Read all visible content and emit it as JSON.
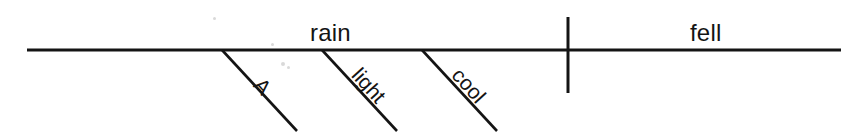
{
  "figure": {
    "kind": "reed-kellogg-sentence-diagram",
    "sentence": "A light cool rain fell.",
    "background_color": "#ffffff",
    "ink_color": "#141414"
  },
  "baseline": {
    "name": "main-horizontal-baseline",
    "x1": 27,
    "x2": 841,
    "y": 50,
    "stroke_width": 3
  },
  "divider": {
    "name": "subject-predicate-divider",
    "x": 568,
    "y1": 17,
    "y2": 93,
    "stroke_width": 3
  },
  "subject": {
    "label": "rain",
    "role": "subject",
    "x": 310,
    "y": 21
  },
  "predicate": {
    "label": "fell",
    "role": "verb",
    "x": 690,
    "y": 21
  },
  "modifiers": [
    {
      "label": "A",
      "role": "article",
      "line": {
        "x1": 222,
        "y1": 50,
        "x2": 297,
        "y2": 131
      },
      "text": {
        "x": 266,
        "y": 74,
        "rotate": 48
      }
    },
    {
      "label": "light",
      "role": "adjective",
      "line": {
        "x1": 322,
        "y1": 50,
        "x2": 397,
        "y2": 131
      },
      "text": {
        "x": 364,
        "y": 64,
        "rotate": 48
      }
    },
    {
      "label": "cool",
      "role": "adjective",
      "line": {
        "x1": 422,
        "y1": 50,
        "x2": 497,
        "y2": 131
      },
      "text": {
        "x": 464,
        "y": 64,
        "rotate": 48
      }
    }
  ],
  "specks": [
    {
      "x": 213,
      "y": 17,
      "d": 3
    },
    {
      "x": 271,
      "y": 43,
      "d": 3
    },
    {
      "x": 281,
      "y": 62,
      "d": 4
    },
    {
      "x": 287,
      "y": 66,
      "d": 3
    }
  ]
}
